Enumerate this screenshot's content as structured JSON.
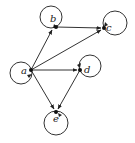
{
  "diagram": {
    "type": "directed-graph",
    "nodes": [
      {
        "id": "a",
        "label": "a",
        "x": 31,
        "y": 70,
        "loop": {
          "cx": 21,
          "cy": 73,
          "r": 11
        }
      },
      {
        "id": "b",
        "label": "b",
        "x": 56,
        "y": 27,
        "loop": {
          "cx": 51,
          "cy": 17,
          "r": 11
        }
      },
      {
        "id": "c",
        "label": "c",
        "x": 104,
        "y": 28,
        "loop": {
          "cx": 115,
          "cy": 23,
          "r": 12
        }
      },
      {
        "id": "d",
        "label": "d",
        "x": 80,
        "y": 70,
        "loop": {
          "cx": 90,
          "cy": 66,
          "r": 11
        }
      },
      {
        "id": "e",
        "label": "e",
        "x": 56,
        "y": 112,
        "loop": {
          "cx": 56,
          "cy": 123,
          "r": 12
        }
      }
    ],
    "edges": [
      {
        "from": "a",
        "to": "b"
      },
      {
        "from": "b",
        "to": "c"
      },
      {
        "from": "a",
        "to": "c"
      },
      {
        "from": "a",
        "to": "d"
      },
      {
        "from": "a",
        "to": "e"
      },
      {
        "from": "d",
        "to": "e"
      },
      {
        "from": "a",
        "to": "a"
      },
      {
        "from": "b",
        "to": "b"
      },
      {
        "from": "c",
        "to": "c"
      },
      {
        "from": "d",
        "to": "d"
      },
      {
        "from": "e",
        "to": "e"
      }
    ]
  }
}
